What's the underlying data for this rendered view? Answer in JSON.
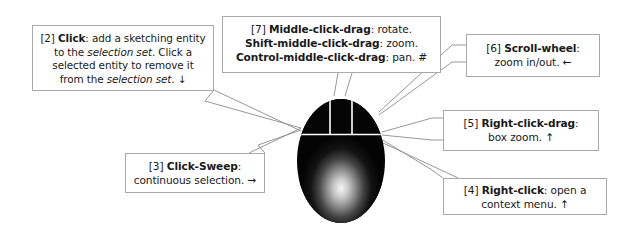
{
  "figure": {
    "graphic": {
      "name": "three-button-mouse",
      "body_color": "#050505",
      "highlight_color": "#f2f2f2",
      "divider_color": "#ffffff"
    },
    "leader_color": "#8c8c8c",
    "box_border_color": "#a9a9a9",
    "text_color": "#1a1a1a",
    "background_color": "#ffffff"
  },
  "callouts": [
    {
      "id": "2",
      "tag": "[2]",
      "action": "Click",
      "lines": [
        {
          "tag": "[2] ",
          "bold": "Click",
          "rest": ": add a sketching entity"
        },
        {
          "pre": "to the ",
          "italic": "selection set",
          "post": ".  Click a"
        },
        {
          "plain": "selected entity to remove it"
        },
        {
          "pre": "from the ",
          "italic": "selection set",
          "post": ".  ",
          "arrow": "↓"
        }
      ]
    },
    {
      "id": "7",
      "tag": "[7]",
      "lines": [
        {
          "tag": "[7] ",
          "bold": "Middle-click-drag",
          "rest": ": rotate."
        },
        {
          "bold": "Shift-middle-click-drag",
          "rest": ": zoom."
        },
        {
          "bold": "Control-middle-click-drag",
          "rest": ": pan.  #"
        }
      ]
    },
    {
      "id": "6",
      "tag": "[6]",
      "lines": [
        {
          "tag": "[6] ",
          "bold": "Scroll-wheel",
          "rest": ":"
        },
        {
          "plain": "zoom in/out.  ",
          "arrow": "←"
        }
      ]
    },
    {
      "id": "5",
      "tag": "[5]",
      "lines": [
        {
          "tag": "[5] ",
          "bold": "Right-click-drag",
          "rest": ":"
        },
        {
          "plain": "box zoom.  ",
          "arrow": "↑"
        }
      ]
    },
    {
      "id": "4",
      "tag": "[4]",
      "lines": [
        {
          "tag": "[4] ",
          "bold": "Right-click",
          "rest": ": open a"
        },
        {
          "plain": "context menu.  ",
          "arrow": "↑"
        }
      ]
    },
    {
      "id": "3",
      "tag": "[3]",
      "lines": [
        {
          "tag": "[3] ",
          "bold": "Click-Sweep",
          "rest": ":"
        },
        {
          "plain": "continuous selection.  ",
          "arrow": "→"
        }
      ]
    }
  ],
  "text": {
    "c2_l1_tag": "[2] ",
    "c2_l1_bold": "Click",
    "c2_l1_rest": ": add a sketching entity",
    "c2_l2_pre": "to the ",
    "c2_l2_italic": "selection set",
    "c2_l2_post": ".  Click a",
    "c2_l3": "selected entity to remove it",
    "c2_l4_pre": "from the ",
    "c2_l4_italic": "selection set",
    "c2_l4_post": ".  ",
    "c2_l4_arrow": "↓",
    "c7_l1_tag": "[7] ",
    "c7_l1_bold": "Middle-click-drag",
    "c7_l1_rest": ": rotate.",
    "c7_l2_bold": "Shift-middle-click-drag",
    "c7_l2_rest": ": zoom.",
    "c7_l3_bold": "Control-middle-click-drag",
    "c7_l3_rest": ": pan.  #",
    "c6_l1_tag": "[6] ",
    "c6_l1_bold": "Scroll-wheel",
    "c6_l1_rest": ":",
    "c6_l2": "zoom in/out.  ",
    "c6_l2_arrow": "←",
    "c5_l1_tag": "[5] ",
    "c5_l1_bold": "Right-click-drag",
    "c5_l1_rest": ":",
    "c5_l2": "box zoom.  ",
    "c5_l2_arrow": "↑",
    "c4_l1_tag": "[4] ",
    "c4_l1_bold": "Right-click",
    "c4_l1_rest": ": open a",
    "c4_l2": "context menu.  ",
    "c4_l2_arrow": "↑",
    "c3_l1_tag": "[3] ",
    "c3_l1_bold": "Click-Sweep",
    "c3_l1_rest": ":",
    "c3_l2": "continuous selection.  ",
    "c3_l2_arrow": "→"
  }
}
